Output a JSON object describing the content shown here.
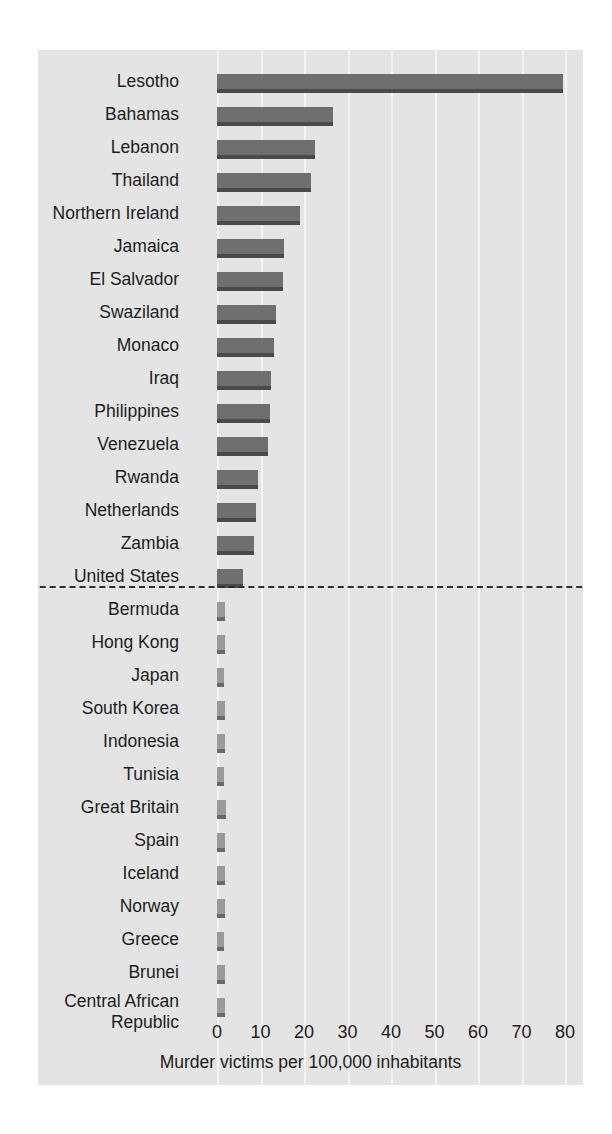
{
  "chart_data": {
    "type": "bar",
    "orientation": "horizontal",
    "title": "",
    "xlabel": "Murder victims per 100,000 inhabitants",
    "ylabel": "",
    "xlim": [
      0,
      84
    ],
    "xticks": [
      0,
      10,
      20,
      30,
      40,
      50,
      60,
      70,
      80
    ],
    "xtick_labels": [
      "0",
      "10",
      "20",
      "30",
      "40",
      "50",
      "60",
      "70",
      "80"
    ],
    "grid": "vertical",
    "legend": "none",
    "categories": [
      "Lesotho",
      "Bahamas",
      "Lebanon",
      "Thailand",
      "Northern Ireland",
      "Jamaica",
      "El Salvador",
      "Swaziland",
      "Monaco",
      "Iraq",
      "Philippines",
      "Venezuela",
      "Rwanda",
      "Netherlands",
      "Zambia",
      "United States",
      "Bermuda",
      "Hong Kong",
      "Japan",
      "South Korea",
      "Indonesia",
      "Tunisia",
      "Great Britain",
      "Spain",
      "Iceland",
      "Norway",
      "Greece",
      "Brunei",
      "Central African Republic"
    ],
    "values": [
      79.5,
      26.6,
      22.5,
      21.5,
      19.0,
      15.5,
      15.2,
      13.6,
      13.0,
      12.4,
      12.2,
      11.8,
      9.4,
      8.9,
      8.5,
      6.0,
      1.9,
      1.9,
      1.7,
      1.8,
      1.8,
      1.6,
      2.0,
      1.8,
      1.9,
      1.8,
      1.7,
      1.8,
      1.9
    ],
    "separator": {
      "after_category": "United States",
      "style": "dashed",
      "color": "#2e2e2e"
    },
    "colors": {
      "bar": "#6f6f6f",
      "bar_shadow": "#4a4a4a",
      "plot_background": "#e4e4e4",
      "gridline": "#f4f4f4",
      "text": "#1c1c1c",
      "page_background": "#ffffff"
    }
  },
  "axis": {
    "label": "Murder victims per 100,000 inhabitants"
  }
}
